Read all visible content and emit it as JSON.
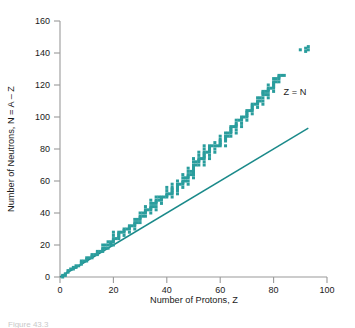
{
  "figure": {
    "caption": "Figure 43.3",
    "background_color": "#ffffff"
  },
  "chart_data": {
    "type": "scatter",
    "title": "",
    "xlabel": "Number of Protons, Z",
    "ylabel": "Number of Neutrons, N = A – Z",
    "xlim": [
      0,
      100
    ],
    "ylim": [
      0,
      160
    ],
    "xticks": [
      0,
      20,
      40,
      60,
      80,
      100
    ],
    "yticks": [
      0,
      20,
      40,
      60,
      80,
      100,
      120,
      140,
      160
    ],
    "xtick_labels": [
      "0",
      "20",
      "40",
      "60",
      "80",
      "100"
    ],
    "ytick_labels": [
      "0",
      "20",
      "40",
      "60",
      "80",
      "100",
      "120",
      "140",
      "160"
    ],
    "grid": false,
    "legend_position": "none",
    "marker": "square",
    "marker_color": "#2a9d9d",
    "line_color": "#1b8a8a",
    "series": [
      {
        "name": "stable-nuclei",
        "type": "scatter",
        "marker_color": "#2a9d9d",
        "points": [
          [
            1,
            0
          ],
          [
            1,
            1
          ],
          [
            2,
            1
          ],
          [
            2,
            2
          ],
          [
            3,
            3
          ],
          [
            3,
            4
          ],
          [
            4,
            5
          ],
          [
            5,
            5
          ],
          [
            5,
            6
          ],
          [
            6,
            6
          ],
          [
            6,
            7
          ],
          [
            7,
            7
          ],
          [
            8,
            8
          ],
          [
            8,
            9
          ],
          [
            8,
            10
          ],
          [
            9,
            10
          ],
          [
            10,
            10
          ],
          [
            10,
            11
          ],
          [
            10,
            12
          ],
          [
            11,
            12
          ],
          [
            12,
            12
          ],
          [
            12,
            13
          ],
          [
            12,
            14
          ],
          [
            13,
            14
          ],
          [
            14,
            14
          ],
          [
            14,
            15
          ],
          [
            14,
            16
          ],
          [
            15,
            16
          ],
          [
            16,
            16
          ],
          [
            16,
            17
          ],
          [
            16,
            18
          ],
          [
            16,
            20
          ],
          [
            17,
            18
          ],
          [
            17,
            20
          ],
          [
            18,
            18
          ],
          [
            18,
            20
          ],
          [
            18,
            22
          ],
          [
            19,
            20
          ],
          [
            19,
            21
          ],
          [
            19,
            22
          ],
          [
            20,
            20
          ],
          [
            20,
            22
          ],
          [
            20,
            23
          ],
          [
            20,
            24
          ],
          [
            20,
            26
          ],
          [
            20,
            28
          ],
          [
            21,
            24
          ],
          [
            22,
            24
          ],
          [
            22,
            25
          ],
          [
            22,
            26
          ],
          [
            22,
            27
          ],
          [
            22,
            28
          ],
          [
            23,
            28
          ],
          [
            24,
            26
          ],
          [
            24,
            28
          ],
          [
            24,
            29
          ],
          [
            24,
            30
          ],
          [
            25,
            30
          ],
          [
            26,
            28
          ],
          [
            26,
            30
          ],
          [
            26,
            31
          ],
          [
            26,
            32
          ],
          [
            27,
            32
          ],
          [
            28,
            30
          ],
          [
            28,
            32
          ],
          [
            28,
            33
          ],
          [
            28,
            34
          ],
          [
            28,
            36
          ],
          [
            29,
            34
          ],
          [
            29,
            36
          ],
          [
            30,
            34
          ],
          [
            30,
            36
          ],
          [
            30,
            37
          ],
          [
            30,
            38
          ],
          [
            30,
            40
          ],
          [
            31,
            38
          ],
          [
            31,
            40
          ],
          [
            32,
            38
          ],
          [
            32,
            40
          ],
          [
            32,
            41
          ],
          [
            32,
            42
          ],
          [
            32,
            44
          ],
          [
            33,
            42
          ],
          [
            34,
            40
          ],
          [
            34,
            42
          ],
          [
            34,
            43
          ],
          [
            34,
            44
          ],
          [
            34,
            46
          ],
          [
            34,
            48
          ],
          [
            35,
            44
          ],
          [
            35,
            46
          ],
          [
            36,
            42
          ],
          [
            36,
            44
          ],
          [
            36,
            46
          ],
          [
            36,
            47
          ],
          [
            36,
            48
          ],
          [
            36,
            50
          ],
          [
            37,
            48
          ],
          [
            37,
            50
          ],
          [
            38,
            46
          ],
          [
            38,
            48
          ],
          [
            38,
            49
          ],
          [
            38,
            50
          ],
          [
            39,
            50
          ],
          [
            40,
            50
          ],
          [
            40,
            51
          ],
          [
            40,
            52
          ],
          [
            40,
            54
          ],
          [
            40,
            56
          ],
          [
            41,
            52
          ],
          [
            42,
            50
          ],
          [
            42,
            52
          ],
          [
            42,
            53
          ],
          [
            42,
            54
          ],
          [
            42,
            55
          ],
          [
            42,
            56
          ],
          [
            42,
            58
          ],
          [
            44,
            52
          ],
          [
            44,
            54
          ],
          [
            44,
            55
          ],
          [
            44,
            56
          ],
          [
            44,
            57
          ],
          [
            44,
            58
          ],
          [
            44,
            60
          ],
          [
            45,
            58
          ],
          [
            46,
            56
          ],
          [
            46,
            58
          ],
          [
            46,
            59
          ],
          [
            46,
            60
          ],
          [
            46,
            62
          ],
          [
            46,
            64
          ],
          [
            47,
            60
          ],
          [
            47,
            62
          ],
          [
            48,
            58
          ],
          [
            48,
            60
          ],
          [
            48,
            62
          ],
          [
            48,
            63
          ],
          [
            48,
            64
          ],
          [
            48,
            66
          ],
          [
            48,
            68
          ],
          [
            49,
            64
          ],
          [
            49,
            66
          ],
          [
            50,
            62
          ],
          [
            50,
            64
          ],
          [
            50,
            65
          ],
          [
            50,
            66
          ],
          [
            50,
            67
          ],
          [
            50,
            68
          ],
          [
            50,
            69
          ],
          [
            50,
            70
          ],
          [
            50,
            72
          ],
          [
            50,
            74
          ],
          [
            51,
            70
          ],
          [
            51,
            72
          ],
          [
            52,
            70
          ],
          [
            52,
            72
          ],
          [
            52,
            73
          ],
          [
            52,
            74
          ],
          [
            52,
            76
          ],
          [
            52,
            78
          ],
          [
            53,
            74
          ],
          [
            54,
            70
          ],
          [
            54,
            72
          ],
          [
            54,
            74
          ],
          [
            54,
            75
          ],
          [
            54,
            76
          ],
          [
            54,
            77
          ],
          [
            54,
            78
          ],
          [
            54,
            80
          ],
          [
            54,
            82
          ],
          [
            55,
            78
          ],
          [
            56,
            74
          ],
          [
            56,
            76
          ],
          [
            56,
            78
          ],
          [
            56,
            79
          ],
          [
            56,
            80
          ],
          [
            56,
            81
          ],
          [
            56,
            82
          ],
          [
            57,
            82
          ],
          [
            58,
            78
          ],
          [
            58,
            80
          ],
          [
            58,
            82
          ],
          [
            58,
            84
          ],
          [
            59,
            82
          ],
          [
            60,
            82
          ],
          [
            60,
            83
          ],
          [
            60,
            84
          ],
          [
            60,
            85
          ],
          [
            60,
            86
          ],
          [
            60,
            88
          ],
          [
            62,
            82
          ],
          [
            62,
            85
          ],
          [
            62,
            86
          ],
          [
            62,
            87
          ],
          [
            62,
            88
          ],
          [
            62,
            90
          ],
          [
            63,
            88
          ],
          [
            63,
            90
          ],
          [
            64,
            88
          ],
          [
            64,
            90
          ],
          [
            64,
            91
          ],
          [
            64,
            92
          ],
          [
            64,
            93
          ],
          [
            64,
            94
          ],
          [
            65,
            94
          ],
          [
            66,
            90
          ],
          [
            66,
            92
          ],
          [
            66,
            94
          ],
          [
            66,
            95
          ],
          [
            66,
            96
          ],
          [
            66,
            98
          ],
          [
            67,
            98
          ],
          [
            68,
            94
          ],
          [
            68,
            96
          ],
          [
            68,
            98
          ],
          [
            68,
            99
          ],
          [
            68,
            100
          ],
          [
            69,
            100
          ],
          [
            70,
            98
          ],
          [
            70,
            100
          ],
          [
            70,
            101
          ],
          [
            70,
            102
          ],
          [
            70,
            103
          ],
          [
            70,
            104
          ],
          [
            71,
            104
          ],
          [
            72,
            102
          ],
          [
            72,
            104
          ],
          [
            72,
            105
          ],
          [
            72,
            106
          ],
          [
            72,
            107
          ],
          [
            72,
            108
          ],
          [
            73,
            108
          ],
          [
            74,
            106
          ],
          [
            74,
            108
          ],
          [
            74,
            109
          ],
          [
            74,
            110
          ],
          [
            74,
            112
          ],
          [
            75,
            110
          ],
          [
            75,
            112
          ],
          [
            76,
            108
          ],
          [
            76,
            110
          ],
          [
            76,
            112
          ],
          [
            76,
            114
          ],
          [
            76,
            115
          ],
          [
            76,
            116
          ],
          [
            77,
            114
          ],
          [
            77,
            116
          ],
          [
            78,
            112
          ],
          [
            78,
            114
          ],
          [
            78,
            116
          ],
          [
            78,
            117
          ],
          [
            78,
            118
          ],
          [
            78,
            120
          ],
          [
            79,
            118
          ],
          [
            80,
            116
          ],
          [
            80,
            118
          ],
          [
            80,
            119
          ],
          [
            80,
            120
          ],
          [
            80,
            121
          ],
          [
            80,
            122
          ],
          [
            80,
            124
          ],
          [
            81,
            122
          ],
          [
            81,
            124
          ],
          [
            82,
            122
          ],
          [
            82,
            124
          ],
          [
            82,
            125
          ],
          [
            82,
            126
          ],
          [
            83,
            126
          ],
          [
            84,
            126
          ],
          [
            90,
            142
          ],
          [
            92,
            141
          ],
          [
            92,
            143
          ],
          [
            93,
            142
          ],
          [
            93,
            144
          ]
        ]
      },
      {
        "name": "Z = N",
        "type": "line",
        "label": "Z = N",
        "label_x": 88,
        "label_y": 114,
        "line_color": "#1b8a8a",
        "x0": 0,
        "y0": 0,
        "x1": 93,
        "y1": 93
      }
    ]
  }
}
